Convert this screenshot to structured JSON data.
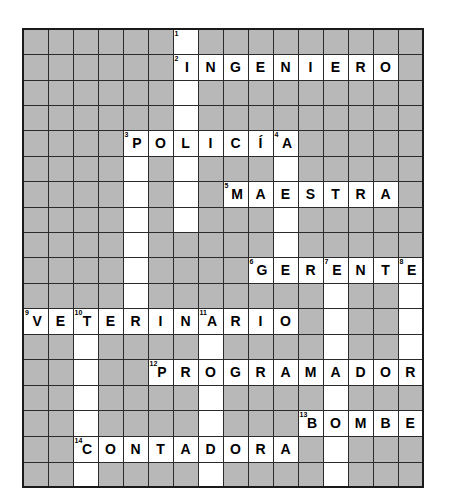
{
  "puzzle": {
    "title": "Crossword puzzle grid",
    "type": "crossword",
    "rows": 16,
    "cols": 16,
    "cell_size_px": 25,
    "colors": {
      "blocked_cell": "#b8b8b8",
      "open_cell": "#ffffff",
      "grid_line": "#2b2b2b",
      "border": "#1a1a1a",
      "text": "#000000"
    },
    "entries": [
      {
        "number": 1,
        "direction": "down",
        "row": 0,
        "col": 6,
        "answer": ""
      },
      {
        "number": 2,
        "direction": "across",
        "row": 1,
        "col": 6,
        "answer": "INGENIERO"
      },
      {
        "number": 3,
        "direction": "across",
        "row": 4,
        "col": 4,
        "answer": "POLICIA"
      },
      {
        "number": 4,
        "direction": "down",
        "row": 4,
        "col": 10,
        "answer": ""
      },
      {
        "number": 5,
        "direction": "across",
        "row": 6,
        "col": 8,
        "answer": "MAESTRA"
      },
      {
        "number": 6,
        "direction": "across",
        "row": 9,
        "col": 9,
        "answer": "GERENTE"
      },
      {
        "number": 7,
        "direction": "down",
        "row": 9,
        "col": 12,
        "answer": ""
      },
      {
        "number": 8,
        "direction": "down",
        "row": 9,
        "col": 15,
        "answer": ""
      },
      {
        "number": 9,
        "direction": "across",
        "row": 11,
        "col": 0,
        "answer": "VETERINARIO"
      },
      {
        "number": 10,
        "direction": "down",
        "row": 11,
        "col": 2,
        "answer": ""
      },
      {
        "number": 11,
        "direction": "down",
        "row": 11,
        "col": 7,
        "answer": ""
      },
      {
        "number": 12,
        "direction": "across",
        "row": 13,
        "col": 5,
        "answer": "PROGRAMADORA"
      },
      {
        "number": 13,
        "direction": "across",
        "row": 15,
        "col": 11,
        "answer": "BOMBERO"
      },
      {
        "number": 14,
        "direction": "across",
        "row": 16,
        "col": 2,
        "answer": "CONTADORA"
      }
    ],
    "grid": [
      [
        {
          "s": "block"
        },
        {
          "s": "block"
        },
        {
          "s": "block"
        },
        {
          "s": "block"
        },
        {
          "s": "block"
        },
        {
          "s": "block"
        },
        {
          "s": "open",
          "n": "1",
          "l": ""
        },
        {
          "s": "block"
        },
        {
          "s": "block"
        },
        {
          "s": "block"
        },
        {
          "s": "block"
        },
        {
          "s": "block"
        },
        {
          "s": "block"
        },
        {
          "s": "block"
        },
        {
          "s": "block"
        },
        {
          "s": "block"
        }
      ],
      [
        {
          "s": "block"
        },
        {
          "s": "block"
        },
        {
          "s": "block"
        },
        {
          "s": "block"
        },
        {
          "s": "block"
        },
        {
          "s": "block"
        },
        {
          "s": "open",
          "n": "2",
          "l": "I"
        },
        {
          "s": "open",
          "l": "N"
        },
        {
          "s": "open",
          "l": "G"
        },
        {
          "s": "open",
          "l": "E"
        },
        {
          "s": "open",
          "l": "N"
        },
        {
          "s": "open",
          "l": "I"
        },
        {
          "s": "open",
          "l": "E"
        },
        {
          "s": "open",
          "l": "R"
        },
        {
          "s": "open",
          "l": "O"
        },
        {
          "s": "block"
        }
      ],
      [
        {
          "s": "block"
        },
        {
          "s": "block"
        },
        {
          "s": "block"
        },
        {
          "s": "block"
        },
        {
          "s": "block"
        },
        {
          "s": "block"
        },
        {
          "s": "open",
          "l": ""
        },
        {
          "s": "block"
        },
        {
          "s": "block"
        },
        {
          "s": "block"
        },
        {
          "s": "block"
        },
        {
          "s": "block"
        },
        {
          "s": "block"
        },
        {
          "s": "block"
        },
        {
          "s": "block"
        },
        {
          "s": "block"
        }
      ],
      [
        {
          "s": "block"
        },
        {
          "s": "block"
        },
        {
          "s": "block"
        },
        {
          "s": "block"
        },
        {
          "s": "block"
        },
        {
          "s": "block"
        },
        {
          "s": "open",
          "l": ""
        },
        {
          "s": "block"
        },
        {
          "s": "block"
        },
        {
          "s": "block"
        },
        {
          "s": "block"
        },
        {
          "s": "block"
        },
        {
          "s": "block"
        },
        {
          "s": "block"
        },
        {
          "s": "block"
        },
        {
          "s": "block"
        }
      ],
      [
        {
          "s": "block"
        },
        {
          "s": "block"
        },
        {
          "s": "block"
        },
        {
          "s": "block"
        },
        {
          "s": "open",
          "n": "3",
          "l": "P"
        },
        {
          "s": "open",
          "l": "O"
        },
        {
          "s": "open",
          "l": "L"
        },
        {
          "s": "open",
          "l": "I"
        },
        {
          "s": "open",
          "l": "C"
        },
        {
          "s": "open",
          "l": "Í"
        },
        {
          "s": "open",
          "n": "4",
          "l": "A"
        },
        {
          "s": "block"
        },
        {
          "s": "block"
        },
        {
          "s": "block"
        },
        {
          "s": "block"
        },
        {
          "s": "block"
        }
      ],
      [
        {
          "s": "block"
        },
        {
          "s": "block"
        },
        {
          "s": "block"
        },
        {
          "s": "block"
        },
        {
          "s": "open",
          "l": ""
        },
        {
          "s": "block"
        },
        {
          "s": "open",
          "l": ""
        },
        {
          "s": "block"
        },
        {
          "s": "block"
        },
        {
          "s": "block"
        },
        {
          "s": "open",
          "l": ""
        },
        {
          "s": "block"
        },
        {
          "s": "block"
        },
        {
          "s": "block"
        },
        {
          "s": "block"
        },
        {
          "s": "block"
        }
      ],
      [
        {
          "s": "block"
        },
        {
          "s": "block"
        },
        {
          "s": "block"
        },
        {
          "s": "block"
        },
        {
          "s": "open",
          "l": ""
        },
        {
          "s": "block"
        },
        {
          "s": "open",
          "l": ""
        },
        {
          "s": "block"
        },
        {
          "s": "open",
          "n": "5",
          "l": "M"
        },
        {
          "s": "open",
          "l": "A"
        },
        {
          "s": "open",
          "l": "E"
        },
        {
          "s": "open",
          "l": "S"
        },
        {
          "s": "open",
          "l": "T"
        },
        {
          "s": "open",
          "l": "R"
        },
        {
          "s": "open",
          "l": "A"
        },
        {
          "s": "block"
        }
      ],
      [
        {
          "s": "block"
        },
        {
          "s": "block"
        },
        {
          "s": "block"
        },
        {
          "s": "block"
        },
        {
          "s": "open",
          "l": ""
        },
        {
          "s": "block"
        },
        {
          "s": "open",
          "l": ""
        },
        {
          "s": "block"
        },
        {
          "s": "block"
        },
        {
          "s": "block"
        },
        {
          "s": "open",
          "l": ""
        },
        {
          "s": "block"
        },
        {
          "s": "block"
        },
        {
          "s": "block"
        },
        {
          "s": "block"
        },
        {
          "s": "block"
        }
      ],
      [
        {
          "s": "block"
        },
        {
          "s": "block"
        },
        {
          "s": "block"
        },
        {
          "s": "block"
        },
        {
          "s": "open",
          "l": ""
        },
        {
          "s": "block"
        },
        {
          "s": "block"
        },
        {
          "s": "block"
        },
        {
          "s": "block"
        },
        {
          "s": "block"
        },
        {
          "s": "open",
          "l": ""
        },
        {
          "s": "block"
        },
        {
          "s": "block"
        },
        {
          "s": "block"
        },
        {
          "s": "block"
        },
        {
          "s": "block"
        }
      ],
      [
        {
          "s": "block"
        },
        {
          "s": "block"
        },
        {
          "s": "block"
        },
        {
          "s": "block"
        },
        {
          "s": "open",
          "l": ""
        },
        {
          "s": "block"
        },
        {
          "s": "block"
        },
        {
          "s": "block"
        },
        {
          "s": "block"
        },
        {
          "s": "open",
          "n": "6",
          "l": "G"
        },
        {
          "s": "open",
          "l": "E"
        },
        {
          "s": "open",
          "l": "R"
        },
        {
          "s": "open",
          "n": "7",
          "l": "E"
        },
        {
          "s": "open",
          "l": "N"
        },
        {
          "s": "open",
          "l": "T"
        },
        {
          "s": "open",
          "n": "8",
          "l": "E"
        }
      ],
      [
        {
          "s": "block"
        },
        {
          "s": "block"
        },
        {
          "s": "block"
        },
        {
          "s": "block"
        },
        {
          "s": "open",
          "l": ""
        },
        {
          "s": "block"
        },
        {
          "s": "block"
        },
        {
          "s": "block"
        },
        {
          "s": "block"
        },
        {
          "s": "block"
        },
        {
          "s": "block"
        },
        {
          "s": "block"
        },
        {
          "s": "open",
          "l": ""
        },
        {
          "s": "block"
        },
        {
          "s": "block"
        },
        {
          "s": "open",
          "l": ""
        }
      ],
      [
        {
          "s": "open",
          "n": "9",
          "l": "V"
        },
        {
          "s": "open",
          "l": "E"
        },
        {
          "s": "open",
          "n": "10",
          "l": "T"
        },
        {
          "s": "open",
          "l": "E"
        },
        {
          "s": "open",
          "l": "R"
        },
        {
          "s": "open",
          "l": "I"
        },
        {
          "s": "open",
          "l": "N"
        },
        {
          "s": "open",
          "n": "11",
          "l": "A"
        },
        {
          "s": "open",
          "l": "R"
        },
        {
          "s": "open",
          "l": "I"
        },
        {
          "s": "open",
          "l": "O"
        },
        {
          "s": "block"
        },
        {
          "s": "open",
          "l": ""
        },
        {
          "s": "block"
        },
        {
          "s": "block"
        },
        {
          "s": "open",
          "l": ""
        }
      ],
      [
        {
          "s": "block"
        },
        {
          "s": "block"
        },
        {
          "s": "open",
          "l": ""
        },
        {
          "s": "block"
        },
        {
          "s": "block"
        },
        {
          "s": "block"
        },
        {
          "s": "block"
        },
        {
          "s": "open",
          "l": ""
        },
        {
          "s": "block"
        },
        {
          "s": "block"
        },
        {
          "s": "block"
        },
        {
          "s": "block"
        },
        {
          "s": "open",
          "l": ""
        },
        {
          "s": "block"
        },
        {
          "s": "block"
        },
        {
          "s": "open",
          "l": ""
        }
      ],
      [
        {
          "s": "block"
        },
        {
          "s": "block"
        },
        {
          "s": "open",
          "l": ""
        },
        {
          "s": "block"
        },
        {
          "s": "block"
        },
        {
          "s": "open",
          "n": "12",
          "l": "P"
        },
        {
          "s": "open",
          "l": "R"
        },
        {
          "s": "open",
          "l": "O"
        },
        {
          "s": "open",
          "l": "G"
        },
        {
          "s": "open",
          "l": "R"
        },
        {
          "s": "open",
          "l": "A"
        },
        {
          "s": "open",
          "l": "M"
        },
        {
          "s": "open",
          "l": "A"
        },
        {
          "s": "open",
          "l": "D"
        },
        {
          "s": "open",
          "l": "O"
        },
        {
          "s": "open",
          "l": "R"
        }
      ],
      [
        {
          "s": "block"
        },
        {
          "s": "block"
        },
        {
          "s": "open",
          "l": ""
        },
        {
          "s": "block"
        },
        {
          "s": "block"
        },
        {
          "s": "block"
        },
        {
          "s": "block"
        },
        {
          "s": "open",
          "l": ""
        },
        {
          "s": "block"
        },
        {
          "s": "block"
        },
        {
          "s": "block"
        },
        {
          "s": "block"
        },
        {
          "s": "open",
          "l": ""
        },
        {
          "s": "block"
        },
        {
          "s": "block"
        },
        {
          "s": "block"
        }
      ],
      [
        {
          "s": "block"
        },
        {
          "s": "block"
        },
        {
          "s": "open",
          "l": ""
        },
        {
          "s": "block"
        },
        {
          "s": "block"
        },
        {
          "s": "block"
        },
        {
          "s": "block"
        },
        {
          "s": "open",
          "l": ""
        },
        {
          "s": "block"
        },
        {
          "s": "block"
        },
        {
          "s": "block"
        },
        {
          "s": "open",
          "n": "13",
          "l": "B"
        },
        {
          "s": "open",
          "l": "O"
        },
        {
          "s": "open",
          "l": "M"
        },
        {
          "s": "open",
          "l": "B"
        },
        {
          "s": "open",
          "l": "E"
        }
      ]
    ],
    "extra_rows": [
      [
        {
          "s": "block"
        },
        {
          "s": "block"
        },
        {
          "s": "open",
          "n": "14",
          "l": "C"
        },
        {
          "s": "open",
          "l": "O"
        },
        {
          "s": "open",
          "l": "N"
        },
        {
          "s": "open",
          "l": "T"
        },
        {
          "s": "open",
          "l": "A"
        },
        {
          "s": "open",
          "l": "D"
        },
        {
          "s": "open",
          "l": "O"
        },
        {
          "s": "open",
          "l": "R"
        },
        {
          "s": "open",
          "l": "A"
        },
        {
          "s": "block"
        },
        {
          "s": "open",
          "l": ""
        },
        {
          "s": "block"
        },
        {
          "s": "block"
        },
        {
          "s": "block"
        }
      ],
      [
        {
          "s": "block"
        },
        {
          "s": "block"
        },
        {
          "s": "open",
          "l": ""
        },
        {
          "s": "block"
        },
        {
          "s": "block"
        },
        {
          "s": "block"
        },
        {
          "s": "block"
        },
        {
          "s": "open",
          "l": ""
        },
        {
          "s": "block"
        },
        {
          "s": "block"
        },
        {
          "s": "block"
        },
        {
          "s": "block"
        },
        {
          "s": "open",
          "l": ""
        },
        {
          "s": "block"
        },
        {
          "s": "block"
        },
        {
          "s": "block"
        }
      ]
    ],
    "answers_list": [
      "INGENIERO",
      "POLICÍA",
      "MAESTRA",
      "GERENTE",
      "VETERINARIO",
      "PROGRAMADORA",
      "BOMBERO",
      "CONTADORA"
    ]
  }
}
